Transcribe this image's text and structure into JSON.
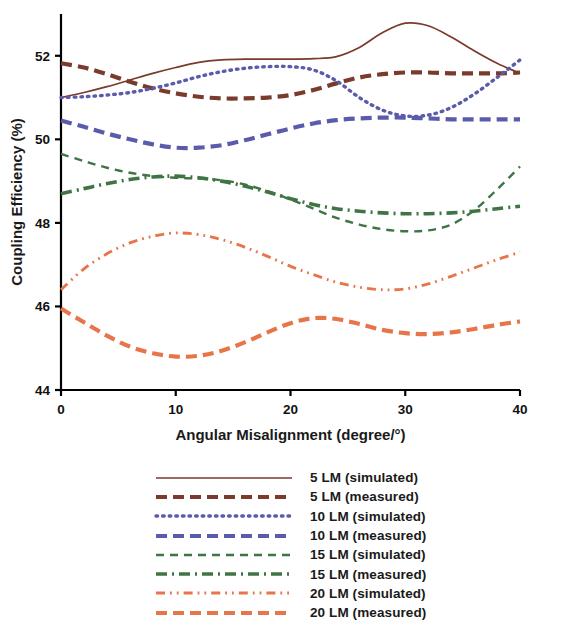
{
  "chart_data": {
    "type": "line",
    "title": "",
    "xlabel": "Angular Misalignment (degree/°)",
    "ylabel": "Coupling Efficiency (%)",
    "xlim": [
      0,
      40
    ],
    "ylim": [
      44,
      53
    ],
    "xticks": [
      "0",
      "10",
      "20",
      "30",
      "40"
    ],
    "xtick_values": [
      0,
      10,
      20,
      30,
      40
    ],
    "yticks": [
      "44",
      "46",
      "48",
      "50",
      "52"
    ],
    "ytick_values": [
      44,
      46,
      48,
      50,
      52
    ],
    "grid": false,
    "legend_position": "below-plot",
    "x": [
      0,
      2,
      4,
      6,
      8,
      10,
      12,
      14,
      16,
      18,
      20,
      22,
      24,
      26,
      28,
      30,
      32,
      34,
      36,
      38,
      40
    ],
    "series": [
      {
        "name": "5 LM (simulated)",
        "color": "#7a3a2c",
        "style": "solid",
        "values": [
          51.0,
          51.12,
          51.26,
          51.42,
          51.58,
          51.72,
          51.84,
          51.9,
          51.92,
          51.92,
          51.92,
          51.93,
          51.98,
          52.2,
          52.55,
          52.78,
          52.72,
          52.45,
          52.12,
          51.82,
          51.58
        ]
      },
      {
        "name": "5 LM (measured)",
        "color": "#7a3a2c",
        "style": "dashed",
        "values": [
          51.82,
          51.72,
          51.56,
          51.38,
          51.22,
          51.1,
          51.02,
          50.98,
          50.98,
          51.0,
          51.06,
          51.18,
          51.34,
          51.48,
          51.56,
          51.6,
          51.6,
          51.58,
          51.58,
          51.58,
          51.6
        ]
      },
      {
        "name": "10 LM (simulated)",
        "color": "#5b5bab",
        "style": "dotted",
        "values": [
          51.0,
          51.02,
          51.06,
          51.12,
          51.22,
          51.35,
          51.5,
          51.62,
          51.7,
          51.74,
          51.74,
          51.66,
          51.4,
          51.0,
          50.7,
          50.56,
          50.58,
          50.76,
          51.08,
          51.48,
          51.9
        ]
      },
      {
        "name": "10 LM (measured)",
        "color": "#5b5bab",
        "style": "dashed",
        "values": [
          50.45,
          50.3,
          50.14,
          50.0,
          49.88,
          49.8,
          49.8,
          49.86,
          49.98,
          50.12,
          50.26,
          50.38,
          50.46,
          50.5,
          50.52,
          50.52,
          50.5,
          50.48,
          50.48,
          50.48,
          50.48
        ]
      },
      {
        "name": "15 LM (simulated)",
        "color": "#3f7544",
        "style": "dashed-fine",
        "values": [
          49.65,
          49.48,
          49.32,
          49.2,
          49.12,
          49.08,
          49.06,
          49.02,
          48.92,
          48.76,
          48.56,
          48.34,
          48.12,
          47.96,
          47.85,
          47.8,
          47.82,
          47.96,
          48.3,
          48.8,
          49.35
        ]
      },
      {
        "name": "15 LM (measured)",
        "color": "#3f7544",
        "style": "dash-dot",
        "values": [
          48.7,
          48.82,
          48.94,
          49.04,
          49.1,
          49.12,
          49.08,
          49.0,
          48.88,
          48.74,
          48.58,
          48.44,
          48.34,
          48.28,
          48.24,
          48.22,
          48.22,
          48.24,
          48.28,
          48.34,
          48.4
        ]
      },
      {
        "name": "20 LM (simulated)",
        "color": "#e8744a",
        "style": "dash-dot-dot",
        "values": [
          46.4,
          46.9,
          47.26,
          47.52,
          47.68,
          47.76,
          47.72,
          47.6,
          47.42,
          47.2,
          46.96,
          46.76,
          46.58,
          46.46,
          46.4,
          46.42,
          46.54,
          46.72,
          46.92,
          47.12,
          47.3
        ]
      },
      {
        "name": "20 LM (measured)",
        "color": "#e8744a",
        "style": "dashed",
        "values": [
          45.95,
          45.62,
          45.3,
          45.04,
          44.88,
          44.8,
          44.82,
          44.94,
          45.14,
          45.38,
          45.6,
          45.72,
          45.7,
          45.58,
          45.44,
          45.36,
          45.34,
          45.38,
          45.46,
          45.56,
          45.64
        ]
      }
    ]
  },
  "legend": {
    "items": [
      {
        "label": "5 LM (simulated)",
        "color": "#7a3a2c",
        "style": "solid"
      },
      {
        "label": "5 LM (measured)",
        "color": "#7a3a2c",
        "style": "dashed"
      },
      {
        "label": "10 LM (simulated)",
        "color": "#5b5bab",
        "style": "dotted"
      },
      {
        "label": "10 LM (measured)",
        "color": "#5b5bab",
        "style": "dashed"
      },
      {
        "label": "15 LM (simulated)",
        "color": "#3f7544",
        "style": "dashed-fine"
      },
      {
        "label": "15 LM (measured)",
        "color": "#3f7544",
        "style": "dash-dot"
      },
      {
        "label": "20 LM (simulated)",
        "color": "#e8744a",
        "style": "dash-dot-dot"
      },
      {
        "label": "20 LM (measured)",
        "color": "#e8744a",
        "style": "dashed"
      }
    ]
  },
  "axis": {
    "color": "#000000"
  }
}
